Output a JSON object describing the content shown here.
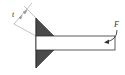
{
  "diagram": {
    "labels": {
      "thickness": "t",
      "force": "F"
    },
    "colors": {
      "weld_fill": "#4a4a4a",
      "line": "#333333",
      "dimension": "#888888",
      "background": "#ffffff"
    }
  }
}
